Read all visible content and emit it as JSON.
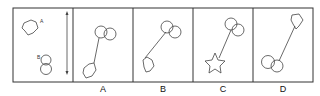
{
  "puzzle": {
    "reference": {
      "label_a": "A",
      "label_b": "B",
      "description": "Polygon A at top-left, figure-eight shape B below, vertical double-headed arrow on right"
    },
    "options": [
      {
        "label": "A"
      },
      {
        "label": "B"
      },
      {
        "label": "C"
      },
      {
        "label": "D"
      }
    ]
  },
  "colors": {
    "stroke": "#333333",
    "background": "#ffffff"
  }
}
